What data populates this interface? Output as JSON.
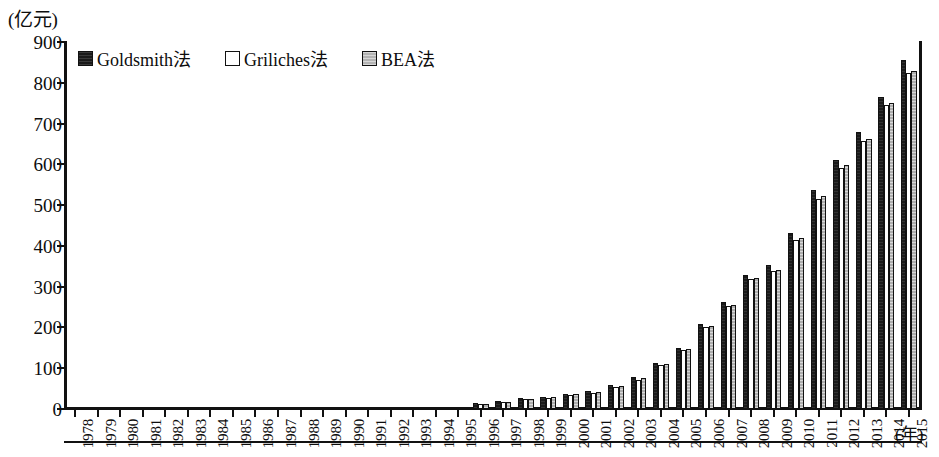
{
  "chart_data": {
    "type": "bar",
    "title": "",
    "subtitle": "",
    "xlabel": "(年)",
    "ylabel": "(亿元)",
    "ylim": [
      0,
      900
    ],
    "ytick_step": 100,
    "yticks": [
      0,
      100,
      200,
      300,
      400,
      500,
      600,
      700,
      800,
      900
    ],
    "grid": false,
    "legend_position": "top-left",
    "categories": [
      "1978",
      "1979",
      "1980",
      "1981",
      "1982",
      "1983",
      "1984",
      "1985",
      "1986",
      "1987",
      "1988",
      "1989",
      "1990",
      "1991",
      "1992",
      "1993",
      "1994",
      "1995",
      "1996",
      "1997",
      "1998",
      "1999",
      "2000",
      "2001",
      "2002",
      "2003",
      "2004",
      "2005",
      "2006",
      "2007",
      "2008",
      "2009",
      "2010",
      "2011",
      "2012",
      "2013",
      "2014",
      "2015"
    ],
    "series": [
      {
        "name": "Goldsmith法",
        "color": "#1a1a1a",
        "values": [
          0,
          0,
          0,
          0,
          0,
          0,
          0,
          6,
          6,
          6,
          6,
          6,
          6,
          6,
          6,
          6,
          6,
          6,
          14,
          20,
          26,
          30,
          38,
          44,
          60,
          78,
          112,
          150,
          208,
          262,
          328,
          352,
          432,
          538,
          610,
          680,
          765,
          855
        ]
      },
      {
        "name": "Griliches法",
        "color": "#ffffff",
        "values": [
          0,
          0,
          0,
          0,
          0,
          0,
          0,
          5,
          5,
          5,
          5,
          5,
          5,
          5,
          5,
          5,
          5,
          5,
          12,
          18,
          24,
          28,
          35,
          40,
          55,
          72,
          108,
          145,
          200,
          252,
          318,
          338,
          415,
          515,
          592,
          658,
          745,
          825
        ]
      },
      {
        "name": "BEA法",
        "color": "#b8b8b8",
        "values": [
          0,
          0,
          0,
          0,
          0,
          0,
          0,
          5,
          5,
          5,
          5,
          5,
          5,
          5,
          5,
          5,
          5,
          5,
          12,
          18,
          25,
          29,
          36,
          42,
          57,
          75,
          110,
          148,
          204,
          256,
          322,
          342,
          420,
          522,
          598,
          662,
          750,
          830
        ]
      }
    ]
  },
  "legend": {
    "items": [
      {
        "label": "Goldsmith法",
        "swatch": "goldsmith"
      },
      {
        "label": "Griliches法",
        "swatch": "griliches"
      },
      {
        "label": "BEA法",
        "swatch": "bea"
      }
    ]
  },
  "axes": {
    "y_unit_label": "(亿元)",
    "x_unit_label": "(年)"
  }
}
